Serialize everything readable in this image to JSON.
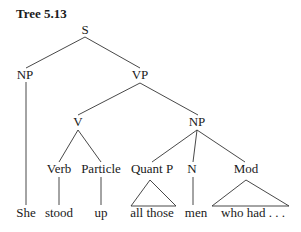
{
  "title": "Tree 5.13",
  "tree": {
    "root": "S",
    "nodes": {
      "S": "S",
      "NP1": "NP",
      "VP": "VP",
      "V": "V",
      "NP2": "NP",
      "Verb": "Verb",
      "Particle": "Particle",
      "QuantP": "Quant P",
      "N": "N",
      "Mod": "Mod"
    },
    "leaves": {
      "she": "She",
      "stood": "stood",
      "up": "up",
      "all_those": "all those",
      "men": "men",
      "who_had": "who had . . ."
    },
    "structure": "[S [NP She] [VP [V [Verb stood] [Particle up]] [NP [Quant P all those] [N men] [Mod who had . . .]]]]"
  }
}
